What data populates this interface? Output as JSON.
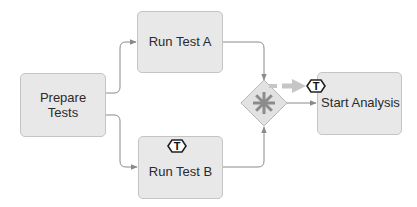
{
  "diagram": {
    "type": "bpmn-process",
    "nodes": {
      "prepare": {
        "label_line1": "Prepare",
        "label_line2": "Tests"
      },
      "test_a": {
        "label": "Run Test A"
      },
      "test_b": {
        "label": "Run Test B",
        "marker": "T"
      },
      "gateway": {
        "type": "complex-gateway",
        "symbol": "asterisk"
      },
      "analysis": {
        "label": "Start Analysis",
        "marker": "T"
      }
    },
    "edges": [
      {
        "from": "prepare",
        "to": "test_a"
      },
      {
        "from": "prepare",
        "to": "test_b"
      },
      {
        "from": "test_a",
        "to": "gateway"
      },
      {
        "from": "test_b",
        "to": "gateway"
      },
      {
        "from": "gateway",
        "to": "analysis"
      }
    ],
    "colors": {
      "task_fill": "#e8e8e8",
      "task_border": "#c4c4c4",
      "edge": "#8a8a8a",
      "gateway_symbol": "#8c8c8c",
      "token_arrow": "#c6c6c6"
    }
  }
}
